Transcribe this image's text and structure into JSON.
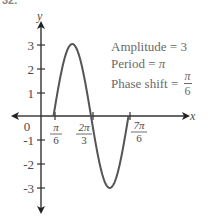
{
  "problem_number": "32.",
  "annotations": {
    "amplitude": "Amplitude = 3",
    "period_label": "Period = ",
    "period_value": "π",
    "phase_label": "Phase shift = ",
    "phase_num": "π",
    "phase_den": "6"
  },
  "axes": {
    "x_label": "x",
    "y_label": "y",
    "origin_label": "0"
  },
  "chart_data": {
    "type": "line",
    "title": "",
    "xlabel": "x",
    "ylabel": "y",
    "function": "y = 3 sin(2x - π/3)",
    "amplitude": 3,
    "period": "π",
    "phase_shift": "π/6",
    "x_ticks": [
      {
        "value": 0.5236,
        "label_num": "π",
        "label_den": "6"
      },
      {
        "value": 2.0944,
        "label_num": "2π",
        "label_den": "3"
      },
      {
        "value": 3.6652,
        "label_num": "7π",
        "label_den": "6"
      }
    ],
    "y_ticks": [
      3,
      2,
      1,
      -1,
      -2,
      -3
    ],
    "ylim": [
      -3.8,
      3.8
    ],
    "x": [
      0.5236,
      1.309,
      2.0944,
      2.8798,
      3.6652
    ],
    "y": [
      0,
      3,
      0,
      -3,
      0
    ],
    "key_points": [
      {
        "x": "π/6",
        "y": 0
      },
      {
        "x": "5π/12",
        "y": 3
      },
      {
        "x": "2π/3",
        "y": 0
      },
      {
        "x": "11π/12",
        "y": -3
      },
      {
        "x": "7π/6",
        "y": 0
      }
    ],
    "grid": false,
    "colors": {
      "curve": "#555555",
      "axes": "#333333",
      "text": "#4a4a4a"
    }
  }
}
